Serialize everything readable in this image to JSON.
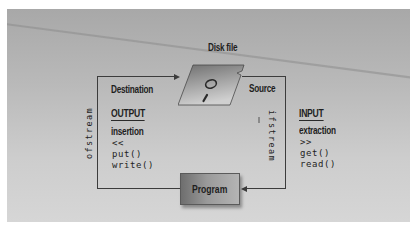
{
  "diagram": {
    "disk_label": "Disk file",
    "program_label": "Program",
    "left": {
      "role": "Destination",
      "stream_class": "ofstream",
      "direction": "OUTPUT",
      "operation": "insertion",
      "operator": "<<",
      "methods": [
        "put()",
        "write()"
      ]
    },
    "right": {
      "role": "Source",
      "stream_class": "ifstream",
      "direction": "INPUT",
      "operation": "extraction",
      "operator": ">>",
      "methods": [
        "get()",
        "read()"
      ]
    },
    "icons": {
      "disk": "floppy-disk-icon"
    },
    "colors": {
      "panel_top": "#a8a8a8",
      "panel_bottom": "#d6d6d6",
      "line": "#3c3c3c",
      "text": "#1e1e1e"
    }
  }
}
